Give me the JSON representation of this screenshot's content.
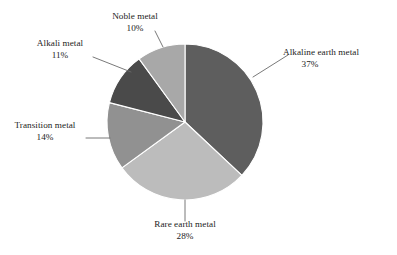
{
  "chart_data": {
    "type": "pie",
    "title": "",
    "categories": [
      "Alkaline earth metal",
      "Rare earth metal",
      "Transition metal",
      "Alkali metal",
      "Noble metal"
    ],
    "values": [
      37,
      28,
      14,
      11,
      10
    ],
    "value_suffix": "%",
    "legend": "none",
    "grid": false,
    "start_angle_deg": 0,
    "direction": "clockwise",
    "slices": [
      {
        "name": "alkaline-earth-metal",
        "label": "Alkaline earth metal",
        "percent_label": "37%",
        "value": 37,
        "color": "#5e5e5e"
      },
      {
        "name": "rare-earth-metal",
        "label": "Rare earth metal",
        "percent_label": "28%",
        "value": 28,
        "color": "#bcbcbc"
      },
      {
        "name": "transition-metal",
        "label": "Transition metal",
        "percent_label": "14%",
        "value": 14,
        "color": "#919191"
      },
      {
        "name": "alkali-metal",
        "label": "Alkali metal",
        "percent_label": "11%",
        "value": 11,
        "color": "#4a4a4a"
      },
      {
        "name": "noble-metal",
        "label": "Noble metal",
        "percent_label": "10%",
        "value": 10,
        "color": "#a8a8a8"
      }
    ],
    "colors": {
      "background": "#ffffff",
      "text": "#1c1c1c",
      "leader_line": "#6a6a6a",
      "slice_border": "#ffffff"
    }
  }
}
